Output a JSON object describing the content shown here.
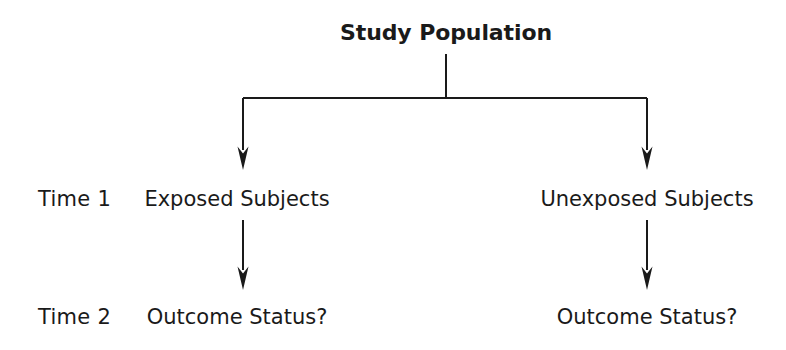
{
  "diagram": {
    "root": {
      "label": "Study Population"
    },
    "row_labels": [
      {
        "id": "time-1",
        "label": "Time 1"
      },
      {
        "id": "time-2",
        "label": "Time 2"
      }
    ],
    "branches": [
      {
        "id": "exposed",
        "time1_label": "Exposed Subjects",
        "time2_label": "Outcome Status?"
      },
      {
        "id": "unexposed",
        "time1_label": "Unexposed Subjects",
        "time2_label": "Outcome Status?"
      }
    ],
    "style": {
      "background": "#ffffff",
      "text_color": "#1a1a1a",
      "line_color": "#1a1a1a",
      "line_width": 2
    }
  }
}
